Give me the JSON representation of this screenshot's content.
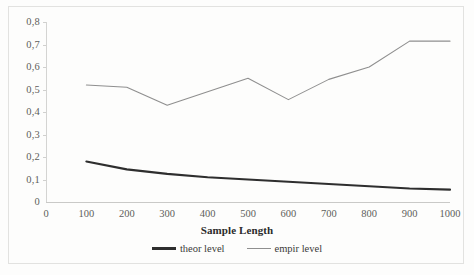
{
  "chart_data": {
    "type": "line",
    "title": "",
    "xlabel": "Sample Length",
    "ylabel": "",
    "xlim": [
      0,
      1000
    ],
    "ylim": [
      0,
      0.8
    ],
    "grid": false,
    "legend_position": "bottom-center",
    "decimal_separator": ",",
    "x": [
      100,
      200,
      300,
      400,
      500,
      600,
      700,
      800,
      900,
      1000
    ],
    "series": [
      {
        "name": "theor level",
        "color": "#2e2e2e",
        "width": 2.2,
        "values": [
          0.18,
          0.145,
          0.125,
          0.11,
          0.1,
          0.09,
          0.08,
          0.07,
          0.06,
          0.055
        ]
      },
      {
        "name": "empir level",
        "color": "#8f8f8f",
        "width": 1.1,
        "values": [
          0.52,
          0.51,
          0.43,
          0.49,
          0.55,
          0.455,
          0.545,
          0.6,
          0.715,
          0.715
        ]
      }
    ],
    "y_ticks": [
      0,
      0.1,
      0.2,
      0.3,
      0.4,
      0.5,
      0.6,
      0.7,
      0.8
    ],
    "y_tick_labels": [
      "0",
      "0,1",
      "0,2",
      "0,3",
      "0,4",
      "0,5",
      "0,6",
      "0,7",
      "0,8"
    ],
    "x_ticks": [
      0,
      100,
      200,
      300,
      400,
      500,
      600,
      700,
      800,
      900,
      1000
    ],
    "x_tick_labels": [
      "0",
      "100",
      "200",
      "300",
      "400",
      "500",
      "600",
      "700",
      "800",
      "900",
      "1000"
    ],
    "legend": [
      {
        "label": "theor level",
        "color": "#2e2e2e"
      },
      {
        "label": "empir level",
        "color": "#8f8f8f"
      }
    ]
  },
  "axis": {
    "x_title": "Sample Length"
  },
  "legend": {
    "theor_label": "theor level",
    "empir_label": "empir level"
  },
  "colors": {
    "theor": "#2e2e2e",
    "empir": "#8f8f8f",
    "axis": "#c9c9c7",
    "text": "#5d5d5b",
    "frame": "#e2e2e0",
    "background": "#fdfdfc"
  }
}
